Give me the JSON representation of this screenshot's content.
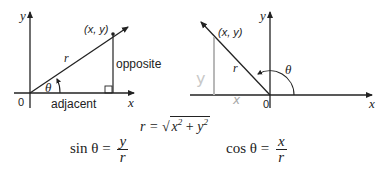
{
  "left_diagram": {
    "axis_x_label": "x",
    "axis_y_label": "y",
    "origin_label": "0",
    "point_label": "(x, y)",
    "hypotenuse_label": "r",
    "angle_label": "θ",
    "opposite_label": "opposite",
    "adjacent_label": "adjacent"
  },
  "right_diagram": {
    "axis_x_label": "x",
    "axis_y_label": "y",
    "origin_label": "0",
    "point_label": "(x, y)",
    "hypotenuse_label": "r",
    "angle_label": "θ",
    "handwritten_y": "y",
    "handwritten_x": "x"
  },
  "formulas": {
    "sin_lhs": "sin θ =",
    "sin_num": "y",
    "sin_den": "r",
    "r_lhs": "r =",
    "r_rad_x": "x",
    "r_rad_plus": " + ",
    "r_rad_y": "y",
    "r_exp": "2",
    "cos_lhs": "cos θ =",
    "cos_num": "x",
    "cos_den": "r"
  },
  "colors": {
    "ink": "#222222",
    "handwriting": "#b8b8b8"
  }
}
